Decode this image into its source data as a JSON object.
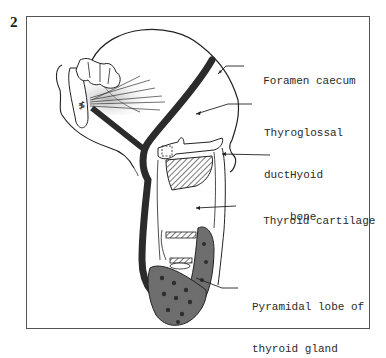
{
  "figure": {
    "number": "2",
    "type": "anatomical sagittal diagram of thyroglossal duct pathway"
  },
  "labels": [
    {
      "id": "foramen-caecum",
      "lines": [
        "Foramen caecum"
      ]
    },
    {
      "id": "thyroglossal-duct",
      "lines": [
        "Thyroglossal",
        "duct"
      ]
    },
    {
      "id": "hyoid-bone",
      "lines": [
        "Hyoid",
        "bone"
      ]
    },
    {
      "id": "thyroid-cartilage",
      "lines": [
        "Thyroid cartilage"
      ]
    },
    {
      "id": "pyramidal-lobe",
      "lines": [
        "Pyramidal lobe of",
        "thyroid gland"
      ]
    }
  ],
  "colors": {
    "line": "#222222",
    "duct": "#2b2b2b",
    "gland_fill": "#6e6e6e",
    "gland_dots": "#2e2e2e",
    "frame": "#555555"
  }
}
